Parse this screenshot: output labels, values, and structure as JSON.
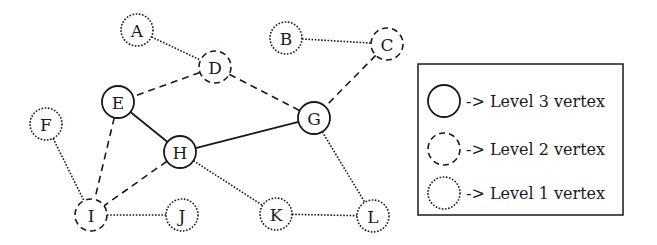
{
  "diagram": {
    "type": "graph",
    "colors": {
      "stroke": "#1a1a1a",
      "background": "#ffffff"
    },
    "styles": {
      "3": "solid",
      "2": "dashed",
      "1": "dotted"
    },
    "nodes": [
      {
        "id": "A",
        "label": "A",
        "level": 1
      },
      {
        "id": "B",
        "label": "B",
        "level": 1
      },
      {
        "id": "C",
        "label": "C",
        "level": 2
      },
      {
        "id": "D",
        "label": "D",
        "level": 2
      },
      {
        "id": "E",
        "label": "E",
        "level": 3
      },
      {
        "id": "F",
        "label": "F",
        "level": 1
      },
      {
        "id": "G",
        "label": "G",
        "level": 3
      },
      {
        "id": "H",
        "label": "H",
        "level": 3
      },
      {
        "id": "I",
        "label": "I",
        "level": 2
      },
      {
        "id": "J",
        "label": "J",
        "level": 1
      },
      {
        "id": "K",
        "label": "K",
        "level": 1
      },
      {
        "id": "L",
        "label": "L",
        "level": 1
      }
    ],
    "edges": [
      {
        "from": "A",
        "to": "D",
        "style": "dotted"
      },
      {
        "from": "B",
        "to": "C",
        "style": "dotted"
      },
      {
        "from": "D",
        "to": "E",
        "style": "dashed"
      },
      {
        "from": "D",
        "to": "G",
        "style": "dashed"
      },
      {
        "from": "C",
        "to": "G",
        "style": "dashed"
      },
      {
        "from": "E",
        "to": "H",
        "style": "solid"
      },
      {
        "from": "H",
        "to": "G",
        "style": "solid"
      },
      {
        "from": "E",
        "to": "I",
        "style": "dashed"
      },
      {
        "from": "H",
        "to": "I",
        "style": "dashed"
      },
      {
        "from": "F",
        "to": "I",
        "style": "dotted"
      },
      {
        "from": "I",
        "to": "J",
        "style": "dotted"
      },
      {
        "from": "H",
        "to": "K",
        "style": "dotted"
      },
      {
        "from": "G",
        "to": "L",
        "style": "dotted"
      },
      {
        "from": "K",
        "to": "L",
        "style": "dotted"
      }
    ],
    "legend": [
      {
        "level": 3,
        "style": "solid",
        "text": "-> Level 3 vertex"
      },
      {
        "level": 2,
        "style": "dashed",
        "text": "-> Level 2 vertex"
      },
      {
        "level": 1,
        "style": "dotted",
        "text": "-> Level 1 vertex"
      }
    ]
  }
}
